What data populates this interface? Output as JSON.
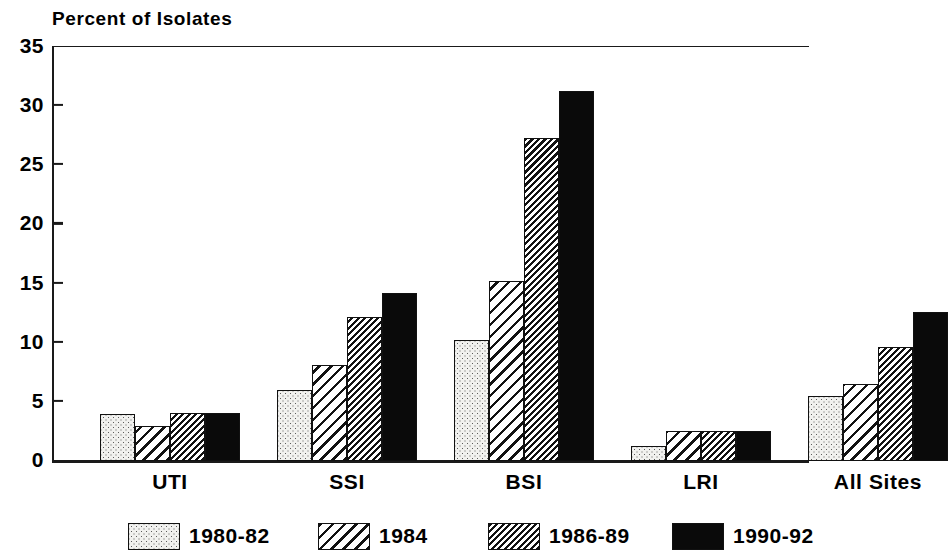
{
  "chart_data": {
    "type": "bar",
    "title": "Percent of Isolates",
    "xlabel": "",
    "ylabel": "",
    "ylim": [
      0,
      35
    ],
    "yticks": [
      0,
      5,
      10,
      15,
      20,
      25,
      30,
      35
    ],
    "ytick_labels": [
      "0",
      "5",
      "10",
      "15",
      "20",
      "25",
      "30",
      "35"
    ],
    "grid": false,
    "legend_position": "bottom",
    "categories": [
      "UTI",
      "SSI",
      "BSI",
      "LRI",
      "All Sites"
    ],
    "series": [
      {
        "name": "1980-82",
        "pattern": "dotted",
        "values": [
          4.0,
          6.0,
          10.2,
          1.3,
          5.5
        ]
      },
      {
        "name": "1984",
        "pattern": "hatch-wide",
        "values": [
          3.0,
          8.1,
          15.2,
          2.5,
          6.5
        ]
      },
      {
        "name": "1986-89",
        "pattern": "hatch-dense",
        "values": [
          4.1,
          12.2,
          27.3,
          2.5,
          9.6
        ]
      },
      {
        "name": "1990-92",
        "pattern": "solid",
        "values": [
          4.1,
          14.2,
          31.3,
          2.5,
          12.6
        ]
      }
    ]
  },
  "legend": {
    "items": [
      {
        "label": "1980-82"
      },
      {
        "label": "1984"
      },
      {
        "label": "1986-89"
      },
      {
        "label": "1990-92"
      }
    ]
  },
  "colors": {
    "axis": "#1a1a1a",
    "bar_outline": "#111111",
    "series_dotted": "#f1f1ef",
    "series_solid": "#0a0a0a",
    "background": "#ffffff"
  }
}
